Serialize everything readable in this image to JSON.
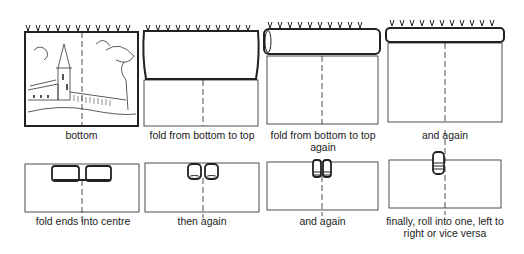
{
  "diagram": {
    "steps": [
      {
        "label": "bottom"
      },
      {
        "label": "fold from bottom to top"
      },
      {
        "label": "fold from bottom to top again"
      },
      {
        "label": "and again"
      },
      {
        "label": "fold ends into centre"
      },
      {
        "label": "then again"
      },
      {
        "label": "and again"
      },
      {
        "label": "finally, roll into one, left to right or vice versa"
      }
    ]
  }
}
